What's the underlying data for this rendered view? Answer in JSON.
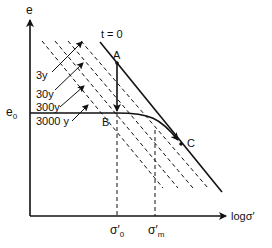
{
  "figure": {
    "axes": {
      "y_label": "e",
      "x_label": "logσ′"
    },
    "curves": {
      "instant_line_label": "t = 0",
      "time_lines": [
        "3y",
        "30y",
        "300y",
        "3000 y"
      ]
    },
    "points": {
      "A": "A",
      "B": "B",
      "C": "C"
    },
    "levels": {
      "e0": "e",
      "e0_sub": "0"
    },
    "stresses": {
      "sigma0": "σ′",
      "sigma0_sub": "0",
      "sigmam": "σ′",
      "sigmam_sub": "m"
    },
    "colors": {
      "line": "#111111",
      "background": "#ffffff"
    }
  }
}
